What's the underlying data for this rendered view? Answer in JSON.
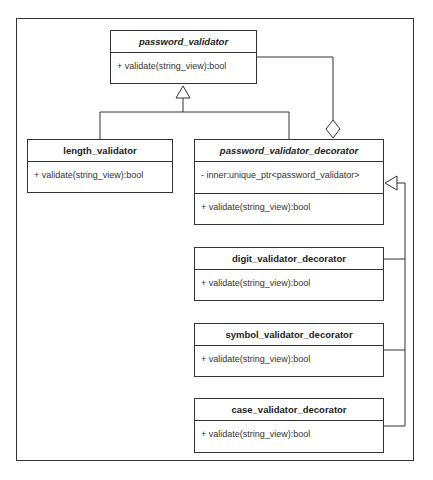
{
  "diagram": {
    "type": "UML class diagram",
    "pattern": "decorator",
    "classes": [
      {
        "id": "password_validator",
        "name": "password_validator",
        "abstract": true,
        "attributes": [],
        "methods": [
          "+ validate(string_view):bool"
        ]
      },
      {
        "id": "length_validator",
        "name": "length_validator",
        "abstract": false,
        "attributes": [],
        "methods": [
          "+ validate(string_view):bool"
        ]
      },
      {
        "id": "password_validator_decorator",
        "name": "password_validator_decorator",
        "abstract": true,
        "attributes": [
          "- inner:unique_ptr<password_validator>"
        ],
        "methods": [
          "+ validate(string_view):bool"
        ]
      },
      {
        "id": "digit_validator_decorator",
        "name": "digit_validator_decorator",
        "abstract": false,
        "attributes": [],
        "methods": [
          "+ validate(string_view):bool"
        ]
      },
      {
        "id": "symbol_validator_decorator",
        "name": "symbol_validator_decorator",
        "abstract": false,
        "attributes": [],
        "methods": [
          "+ validate(string_view):bool"
        ]
      },
      {
        "id": "case_validator_decorator",
        "name": "case_validator_decorator",
        "abstract": false,
        "attributes": [],
        "methods": [
          "+ validate(string_view):bool"
        ]
      }
    ],
    "relationships": [
      {
        "type": "generalization",
        "from": "length_validator",
        "to": "password_validator"
      },
      {
        "type": "generalization",
        "from": "password_validator_decorator",
        "to": "password_validator"
      },
      {
        "type": "aggregation",
        "whole": "password_validator_decorator",
        "part": "password_validator"
      },
      {
        "type": "generalization",
        "from": "digit_validator_decorator",
        "to": "password_validator_decorator"
      },
      {
        "type": "generalization",
        "from": "symbol_validator_decorator",
        "to": "password_validator_decorator"
      },
      {
        "type": "generalization",
        "from": "case_validator_decorator",
        "to": "password_validator_decorator"
      }
    ],
    "colors": {
      "line": "#333333",
      "background": "#ffffff",
      "text": "#222222"
    }
  }
}
